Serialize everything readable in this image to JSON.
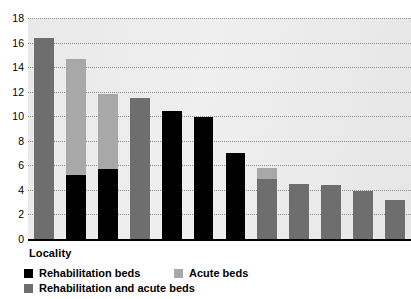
{
  "chart_data": {
    "type": "bar",
    "title": "",
    "xlabel": "Locality",
    "ylabel": "",
    "ylim": [
      0,
      18
    ],
    "ytick_step": 2,
    "yticks": [
      "18",
      "16",
      "14",
      "12",
      "10",
      "8",
      "6",
      "4",
      "2",
      "0"
    ],
    "grid": true,
    "stacked": true,
    "legend_position": "bottom-left",
    "categories": [
      "1",
      "2",
      "3",
      "4",
      "5",
      "6",
      "7",
      "8",
      "9",
      "10",
      "11",
      "12"
    ],
    "series": [
      {
        "name": "Rehabilitation beds",
        "color": "#000000",
        "values": [
          0,
          5.2,
          5.7,
          0,
          10.4,
          9.9,
          7.0,
          0,
          0,
          0,
          0,
          0
        ]
      },
      {
        "name": "Acute beds",
        "color": "#a8a8a8",
        "values": [
          0,
          9.5,
          6.1,
          0,
          0,
          0,
          0,
          0.9,
          0,
          0,
          0,
          0
        ]
      },
      {
        "name": "Rehabilitation and acute beds",
        "color": "#6e6e6e",
        "values": [
          16.4,
          0,
          0,
          11.5,
          0,
          0,
          0,
          4.9,
          4.5,
          4.4,
          3.9,
          3.2
        ]
      }
    ],
    "bar_totals": [
      16.4,
      14.7,
      11.8,
      11.5,
      10.4,
      9.9,
      7.0,
      5.8,
      4.5,
      4.4,
      3.9,
      3.2
    ]
  },
  "legend": {
    "items": [
      {
        "label": "Rehabilitation beds"
      },
      {
        "label": "Acute beds"
      },
      {
        "label": "Rehabilitation and acute beds"
      }
    ]
  },
  "axis": {
    "x_title": "Locality"
  },
  "cropped_top_text": ""
}
